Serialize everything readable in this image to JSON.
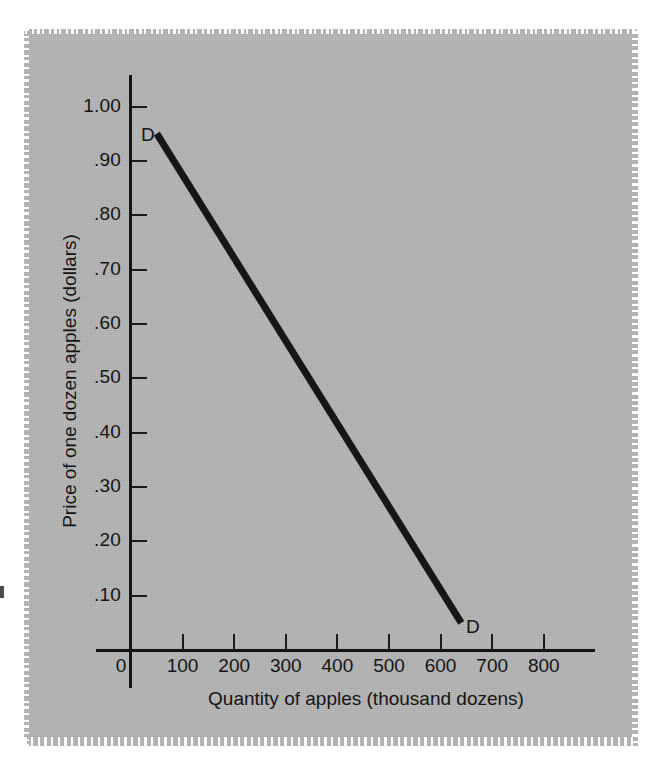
{
  "figure": {
    "background_color": "#b5b5b5",
    "ink_color": "#141414",
    "curve_color": "#161616"
  },
  "chart_data": {
    "type": "line",
    "title": "",
    "subtitle": "",
    "xlabel": "Quantity of apples (thousand dozens)",
    "ylabel": "Price of one dozen apples (dollars)",
    "xlim": [
      0,
      830
    ],
    "ylim": [
      0,
      1.05
    ],
    "grid": false,
    "legend": "none",
    "x_ticks": [
      0,
      100,
      200,
      300,
      400,
      500,
      600,
      700,
      800
    ],
    "x_tick_labels": [
      "0",
      "100",
      "200",
      "300",
      "400",
      "500",
      "600",
      "700",
      "800"
    ],
    "y_ticks": [
      0.1,
      0.2,
      0.3,
      0.4,
      0.5,
      0.6,
      0.7,
      0.8,
      0.9,
      1.0
    ],
    "y_tick_labels": [
      ".10",
      ".20",
      ".30",
      ".40",
      ".50",
      ".60",
      ".70",
      ".80",
      ".90",
      "1.00"
    ],
    "series": [
      {
        "name": "D",
        "kind": "demand-curve",
        "x": [
          50,
          640
        ],
        "y": [
          0.95,
          0.05
        ],
        "endpoint_labels": [
          "D",
          "D"
        ],
        "line_width_px": 7
      }
    ],
    "annotations": [
      {
        "text": "D",
        "x": 50,
        "y": 0.95,
        "position": "upper-left-of-curve-start"
      },
      {
        "text": "D",
        "x": 640,
        "y": 0.05,
        "position": "lower-right-of-curve-end"
      }
    ]
  }
}
